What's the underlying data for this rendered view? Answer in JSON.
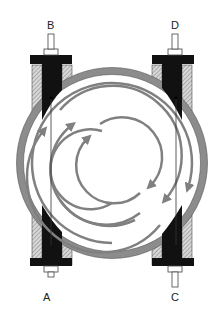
{
  "diagram": {
    "type": "cross-section schematic",
    "ports": [
      {
        "id": "A",
        "label": "A",
        "position": "bottom-left"
      },
      {
        "id": "B",
        "label": "B",
        "position": "top-left"
      },
      {
        "id": "C",
        "label": "C",
        "position": "bottom-right"
      },
      {
        "id": "D",
        "label": "D",
        "position": "top-right"
      }
    ],
    "colors": {
      "ring": "#8c8c8c",
      "arrows": "#808080",
      "block": "#111111",
      "hatch": "#b0b0b0",
      "line": "#555555"
    }
  }
}
